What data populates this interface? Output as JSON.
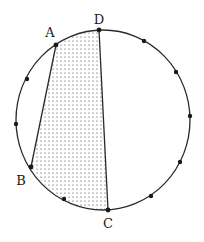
{
  "diagram": {
    "type": "circle-with-quadrilateral",
    "circle": {
      "cx": 103,
      "cy": 120,
      "rx": 87,
      "ry": 90,
      "stroke": "#2a2a2a"
    },
    "shaded_region": {
      "vertices": [
        "A",
        "D",
        "C",
        "B"
      ],
      "fill_pattern": "dots"
    },
    "points": [
      {
        "id": "D",
        "label": "D",
        "x": 99,
        "y": 30,
        "label_x": 99,
        "label_y": 24
      },
      {
        "id": "A",
        "label": "A",
        "x": 56,
        "y": 45,
        "label_x": 50,
        "label_y": 37
      },
      {
        "id": "B",
        "label": "B",
        "x": 31,
        "y": 167,
        "label_x": 21,
        "label_y": 185
      },
      {
        "id": "C",
        "label": "C",
        "x": 108,
        "y": 210,
        "label_x": 108,
        "label_y": 228
      }
    ],
    "extra_dots": [
      {
        "x": 27,
        "y": 79
      },
      {
        "x": 16,
        "y": 124
      },
      {
        "x": 64,
        "y": 199
      },
      {
        "x": 144,
        "y": 41
      },
      {
        "x": 176,
        "y": 72
      },
      {
        "x": 190,
        "y": 116
      },
      {
        "x": 180,
        "y": 162
      },
      {
        "x": 151,
        "y": 196
      }
    ],
    "labels": {
      "A": "A",
      "B": "B",
      "C": "C",
      "D": "D"
    }
  }
}
